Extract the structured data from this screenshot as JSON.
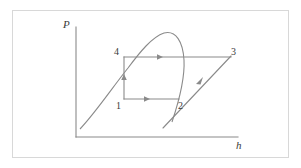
{
  "figure": {
    "kind": "p-h-diagram",
    "stroke_color": "#8a8a8a",
    "axis_color": "#8a8a8a",
    "frame_color": "#d8d8d8",
    "background_color": "#ffffff",
    "text_color": "#3a3a3a"
  },
  "axes": {
    "y_label": "P",
    "x_label": "h",
    "origin": {
      "x": 76,
      "y": 137
    },
    "y_top": {
      "x": 76,
      "y": 27
    },
    "x_right": {
      "x": 238,
      "y": 137
    }
  },
  "state_points": [
    {
      "id": "1",
      "label": "1",
      "x": 124,
      "y": 99,
      "label_x": 116,
      "label_y": 101
    },
    {
      "id": "2",
      "label": "2",
      "x": 178,
      "y": 99,
      "label_x": 178,
      "label_y": 101
    },
    {
      "id": "3",
      "label": "3",
      "x": 230,
      "y": 57,
      "label_x": 231,
      "label_y": 47
    },
    {
      "id": "4",
      "label": "4",
      "x": 124,
      "y": 57,
      "label_x": 114,
      "label_y": 47
    }
  ],
  "processes": [
    {
      "name": "process-1-2",
      "from": "1",
      "to": "2",
      "type": "horizontal",
      "arrow_at": {
        "x": 147,
        "y": 99
      },
      "direction": "right"
    },
    {
      "name": "process-2-3",
      "from": "2",
      "to": "3",
      "type": "diagonal",
      "arrow_at": {
        "x": 201,
        "y": 79
      },
      "direction": "up-right"
    },
    {
      "name": "process-4-3",
      "from": "4",
      "to": "3",
      "type": "horizontal",
      "arrow_at": {
        "x": 160,
        "y": 57
      },
      "direction": "right"
    },
    {
      "name": "process-1-4",
      "from": "1",
      "to": "4",
      "type": "vertical",
      "arrow_at": {
        "x": 124,
        "y": 76
      },
      "direction": "up"
    }
  ],
  "saturation_dome": {
    "name": "saturation-dome",
    "critical_point": {
      "x": 162,
      "y": 33
    },
    "liquid_line_start": {
      "x": 80,
      "y": 129
    },
    "vapor_line_end": {
      "x": 172,
      "y": 122
    }
  },
  "compressor_line": {
    "name": "compression-line",
    "start": {
      "x": 163,
      "y": 128
    },
    "end": {
      "x": 230,
      "y": 57
    }
  }
}
